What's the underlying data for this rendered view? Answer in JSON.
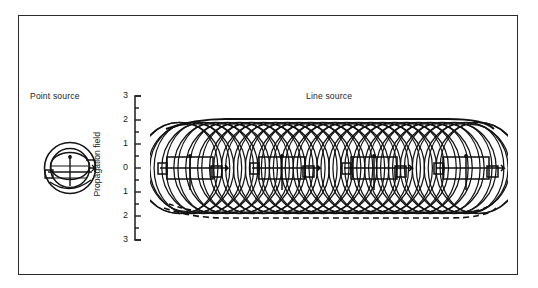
{
  "figure": {
    "background_color": "#ffffff",
    "ink_color": "#1a1a1a",
    "frame": {
      "border_color": "#2b2b2b",
      "x": 18,
      "y": 15,
      "width": 500,
      "height": 260
    }
  },
  "labels": {
    "point_source": "Point source",
    "line_source": "Line source",
    "axis_title": "Propagation field"
  },
  "chart_data": {
    "type": "line",
    "title": "",
    "subtitle": "",
    "xlabel": "",
    "ylabel": "Propagation field",
    "grid": false,
    "legend": null,
    "yaxis": {
      "ticks": [
        3,
        2,
        1,
        0,
        1,
        2,
        3
      ],
      "tick_labels": [
        "3",
        "2",
        "1",
        "0",
        "1",
        "2",
        "3"
      ],
      "minor_ticks_per_interval": 1,
      "ylim": [
        -3,
        3
      ],
      "spine_side": "left",
      "spine_style": "capped"
    },
    "annotations": [
      {
        "text": "Point source",
        "role": "panel-label",
        "x": 0.06,
        "y": 1.02
      },
      {
        "text": "Line source",
        "role": "panel-label",
        "x": 0.57,
        "y": 1.02
      }
    ],
    "series": [
      {
        "name": "point-source-wavefronts",
        "kind": "concentric-circles",
        "center": [
          0.13,
          0.0
        ],
        "radii": [
          0.55,
          0.95,
          1.25
        ],
        "description": "Concentric circular wavefronts radiating from a single point emitter with radial emitter stem and horizontal chord lines"
      },
      {
        "name": "line-source-wavelets",
        "kind": "overlapping-circles",
        "count": 26,
        "radius": 1.9,
        "x_start": 0.3,
        "x_end": 0.97,
        "center_y": 0.0,
        "description": "Huygens wavelets emitted along a horizontal line source; overlapping circular wavefronts construct a plane wave envelope"
      },
      {
        "name": "upper-envelope",
        "kind": "envelope",
        "style": "solid",
        "y": 2.0
      },
      {
        "name": "lower-envelope",
        "kind": "envelope",
        "style": "dashed",
        "y": -2.0
      },
      {
        "name": "emitter-elements",
        "kind": "rect-markers",
        "count": 4,
        "description": "Rectangular emitter cells with centre stems distributed along the line source"
      }
    ]
  }
}
